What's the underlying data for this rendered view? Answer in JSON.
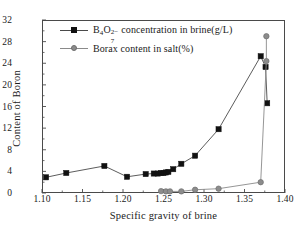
{
  "chart_data": {
    "type": "line",
    "title": "",
    "xlabel": "Specific gravity of brine",
    "ylabel": "Content of Boron",
    "xlim": [
      1.1,
      1.4
    ],
    "ylim": [
      0,
      32
    ],
    "xticks": [
      "1.10",
      "1.15",
      "1.20",
      "1.25",
      "1.30",
      "1.35",
      "1.40"
    ],
    "yticks": [
      "0",
      "4",
      "8",
      "12",
      "16",
      "20",
      "24",
      "28",
      "32"
    ],
    "grid": false,
    "legend_position": "upper-left-inside",
    "series": [
      {
        "name": "B4O7(2-) concentration in brine(g/L)",
        "legend_label_html": "B<sub>4</sub>O<sub>7</sub><sup>2-</sup> concentration in brine(g/L)",
        "marker": "square",
        "color": "#111111",
        "line_color": "#4a4a4a",
        "x": [
          1.105,
          1.13,
          1.177,
          1.205,
          1.228,
          1.238,
          1.243,
          1.247,
          1.25,
          1.253,
          1.256,
          1.262,
          1.272,
          1.289,
          1.318,
          1.37,
          1.376,
          1.378
        ],
        "y": [
          2.9,
          3.7,
          5.0,
          3.0,
          3.5,
          3.6,
          3.6,
          3.7,
          3.7,
          3.8,
          3.9,
          4.4,
          5.4,
          6.9,
          11.8,
          25.3,
          23.3,
          16.6
        ]
      },
      {
        "name": "Borax content in salt(%)",
        "legend_label_html": "Borax content in salt(%)",
        "marker": "circle",
        "color": "#8c8c8c",
        "line_color": "#8a8a8a",
        "x": [
          1.247,
          1.253,
          1.258,
          1.272,
          1.289,
          1.318,
          1.37,
          1.377,
          1.377
        ],
        "y": [
          0.35,
          0.3,
          0.3,
          0.3,
          0.6,
          0.8,
          2.0,
          24.4,
          29.0
        ]
      }
    ]
  },
  "axis": {
    "y_title": "Content of Boron",
    "x_title": "Specific gravity of brine"
  },
  "legend": {
    "items": [
      {
        "label": "B4O7 2- concentration in brine(g/L)",
        "base1": "B",
        "sub1": "4",
        "base2": "O",
        "sub2": "7",
        "sup2": "2−",
        "tail": " concentration in brine(g/L)"
      },
      {
        "label": "Borax content in salt(%)"
      }
    ]
  }
}
